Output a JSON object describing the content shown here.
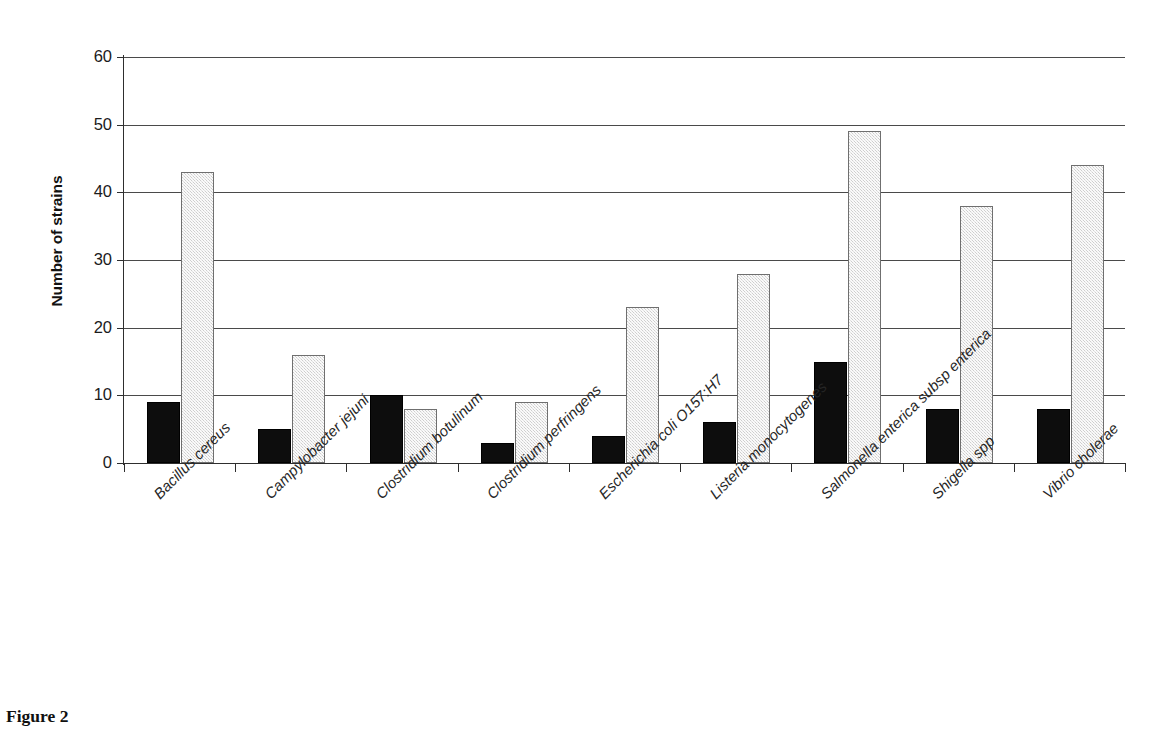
{
  "caption": "Figure 2",
  "chart_data": {
    "type": "bar",
    "title": "",
    "subtitle": "",
    "xlabel": "",
    "ylabel": "Number of strains",
    "ylim": [
      0,
      60
    ],
    "y_ticks": [
      0,
      10,
      20,
      30,
      40,
      50,
      60
    ],
    "grid": "horizontal",
    "legend": "none",
    "legend_position": "none",
    "annotations": [],
    "categories": [
      "Bacillus cereus",
      "Campylobacter jejuni",
      "Clostridium botulinum",
      "Clostridium perfringens",
      "Escherichia coli O157:H7",
      "Listeria monocytogenes",
      "Salmonella enterica subsp enterica",
      "Shigella spp",
      "Vibrio cholerae"
    ],
    "series": [
      {
        "name": "series-1",
        "color": "#0d0d0d",
        "values": [
          9,
          5,
          10,
          3,
          4,
          6,
          15,
          8,
          8
        ]
      },
      {
        "name": "series-2",
        "color": "#e2e2e2",
        "values": [
          43,
          16,
          8,
          9,
          23,
          28,
          49,
          38,
          44
        ]
      }
    ]
  }
}
